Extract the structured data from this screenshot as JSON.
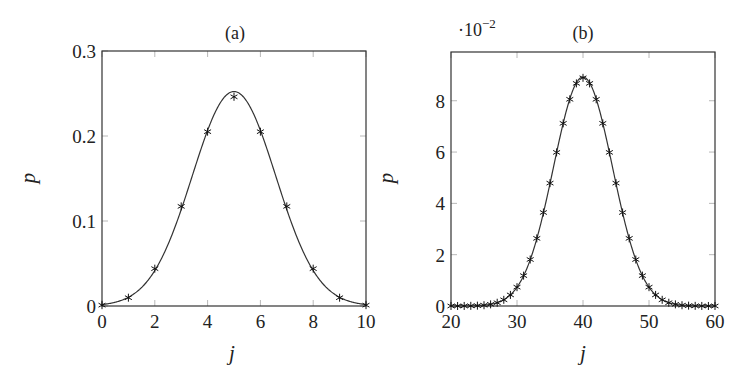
{
  "figure": {
    "panels": [
      "a",
      "b"
    ]
  },
  "chart_data": [
    {
      "id": "a",
      "type": "scatter+line",
      "title": "(a)",
      "xlabel": "j",
      "ylabel": "p",
      "xlim": [
        0,
        10
      ],
      "ylim": [
        0,
        0.3
      ],
      "xticks": [
        0,
        2,
        4,
        6,
        8,
        10
      ],
      "xtick_labels": [
        "0",
        "2",
        "4",
        "6",
        "8",
        "10"
      ],
      "yticks": [
        0,
        0.1,
        0.2,
        0.3
      ],
      "ytick_labels": [
        "0",
        "0.1",
        "0.2",
        "0.3"
      ],
      "y_multiplier_label": "",
      "grid": false,
      "legend": null,
      "series": [
        {
          "name": "binomial (markers)",
          "marker": "star",
          "x": [
            0,
            1,
            2,
            3,
            4,
            5,
            6,
            7,
            8,
            9,
            10
          ],
          "values": [
            0.00098,
            0.00977,
            0.04395,
            0.11719,
            0.20508,
            0.24609,
            0.20508,
            0.11719,
            0.04395,
            0.00977,
            0.00098
          ]
        },
        {
          "name": "normal approximation (curve)",
          "style": "solid line",
          "mean": 5,
          "std": 1.5811
        }
      ],
      "box": {
        "left": 102,
        "top": 51,
        "right": 366,
        "bottom": 306
      },
      "title_pos": [
        235,
        39
      ],
      "xlabel_pos": [
        232,
        360
      ],
      "ylabel_pos": [
        35,
        178
      ]
    },
    {
      "id": "b",
      "type": "scatter+line",
      "title": "(b)",
      "xlabel": "j",
      "ylabel": "p",
      "xlim": [
        20,
        60
      ],
      "ylim": [
        0,
        9.9
      ],
      "xticks": [
        20,
        30,
        40,
        50,
        60
      ],
      "xtick_labels": [
        "20",
        "30",
        "40",
        "50",
        "60"
      ],
      "yticks": [
        0,
        2,
        4,
        6,
        8
      ],
      "ytick_labels": [
        "0",
        "2",
        "4",
        "6",
        "8"
      ],
      "y_multiplier_label": "·10",
      "y_multiplier_exp": "−2",
      "grid": false,
      "legend": null,
      "series": [
        {
          "name": "binomial (markers), values ×10^-2",
          "marker": "star",
          "x": [
            20,
            21,
            22,
            23,
            24,
            25,
            26,
            27,
            28,
            29,
            30,
            31,
            32,
            33,
            34,
            35,
            36,
            37,
            38,
            39,
            40,
            41,
            42,
            43,
            44,
            45,
            46,
            47,
            48,
            49,
            50,
            51,
            52,
            53,
            54,
            55,
            56,
            57,
            58,
            59,
            60
          ],
          "values": [
            0.0003,
            0.0008,
            0.0022,
            0.0057,
            0.0134,
            0.03,
            0.0635,
            0.127,
            0.241,
            0.432,
            0.734,
            1.184,
            1.812,
            2.636,
            3.644,
            4.789,
            5.987,
            7.119,
            8.056,
            8.676,
            8.893,
            8.676,
            8.056,
            7.119,
            5.987,
            4.789,
            3.644,
            2.636,
            1.812,
            1.184,
            0.734,
            0.432,
            0.241,
            0.127,
            0.0635,
            0.03,
            0.0134,
            0.0057,
            0.0022,
            0.0008,
            0.0003
          ]
        },
        {
          "name": "normal approximation (curve)",
          "style": "solid line",
          "mean": 40,
          "std": 4.4721,
          "scale": 100
        }
      ],
      "box": {
        "left": 451,
        "top": 52,
        "right": 715,
        "bottom": 306
      },
      "title_pos": [
        583,
        39
      ],
      "multiplier_pos": [
        458,
        36
      ],
      "xlabel_pos": [
        583,
        360
      ],
      "ylabel_pos": [
        393,
        178
      ]
    }
  ]
}
